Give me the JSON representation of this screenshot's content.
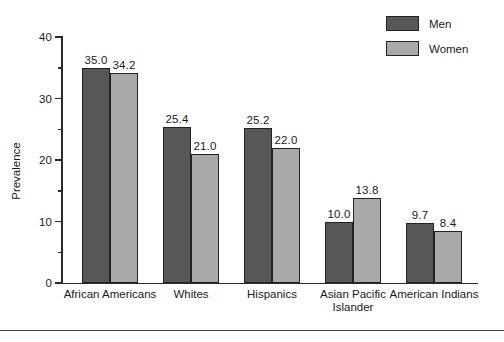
{
  "chart_data": {
    "type": "bar",
    "title": "",
    "xlabel": "",
    "ylabel": "Prevalence",
    "ylim": [
      0,
      40
    ],
    "yticks": [
      0,
      10,
      20,
      30,
      40
    ],
    "ytick_labels": [
      "0",
      "10",
      "20",
      "30",
      "40"
    ],
    "yminor_ticks": [
      5,
      15,
      25,
      35
    ],
    "grid": false,
    "legend_position": "top-right",
    "categories": [
      "African Americans",
      "Whites",
      "Hispanics",
      "Asian Pacific\nIslander",
      "American Indians"
    ],
    "series": [
      {
        "name": "Men",
        "color": "#575757",
        "values": [
          35.0,
          25.4,
          25.2,
          10.0,
          9.7
        ],
        "value_labels": [
          "35.0",
          "25.4",
          "25.2",
          "10.0",
          "9.7"
        ]
      },
      {
        "name": "Women",
        "color": "#a9a9a9",
        "values": [
          34.2,
          21.0,
          22.0,
          13.8,
          8.4
        ],
        "value_labels": [
          "34.2",
          "21.0",
          "22.0",
          "13.8",
          "8.4"
        ]
      }
    ]
  },
  "legend": {
    "items": [
      {
        "label": "Men",
        "color": "#575757"
      },
      {
        "label": "Women",
        "color": "#a9a9a9"
      }
    ]
  },
  "axis": {
    "y_title": "Prevalence"
  }
}
